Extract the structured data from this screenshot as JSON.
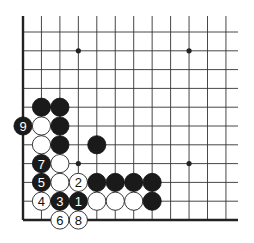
{
  "diagram": {
    "type": "go-board-partial",
    "corner": "bottom-left",
    "grid": {
      "cols": 12,
      "rows": 11,
      "x0": 23,
      "y0": 32,
      "dx": 18.45,
      "dy": 18.8,
      "top_extend": 16,
      "right_extend": 238
    },
    "star_points": [
      {
        "c": 3,
        "r": 1
      },
      {
        "c": 9,
        "r": 1
      },
      {
        "c": 3,
        "r": 7
      },
      {
        "c": 9,
        "r": 7
      }
    ],
    "stones": [
      {
        "c": 1,
        "r": 4,
        "color": "black",
        "label": ""
      },
      {
        "c": 2,
        "r": 4,
        "color": "black",
        "label": ""
      },
      {
        "c": 0,
        "r": 5,
        "color": "black",
        "label": "9"
      },
      {
        "c": 1,
        "r": 5,
        "color": "white",
        "label": ""
      },
      {
        "c": 2,
        "r": 5,
        "color": "black",
        "label": ""
      },
      {
        "c": 1,
        "r": 6,
        "color": "white",
        "label": ""
      },
      {
        "c": 2,
        "r": 6,
        "color": "black",
        "label": ""
      },
      {
        "c": 4,
        "r": 6,
        "color": "black",
        "label": ""
      },
      {
        "c": 1,
        "r": 7,
        "color": "black",
        "label": "7"
      },
      {
        "c": 2,
        "r": 7,
        "color": "white",
        "label": ""
      },
      {
        "c": 1,
        "r": 8,
        "color": "black",
        "label": "5"
      },
      {
        "c": 2,
        "r": 8,
        "color": "white",
        "label": ""
      },
      {
        "c": 3,
        "r": 8,
        "color": "white",
        "label": "2"
      },
      {
        "c": 4,
        "r": 8,
        "color": "black",
        "label": ""
      },
      {
        "c": 5,
        "r": 8,
        "color": "black",
        "label": ""
      },
      {
        "c": 6,
        "r": 8,
        "color": "black",
        "label": ""
      },
      {
        "c": 7,
        "r": 8,
        "color": "black",
        "label": ""
      },
      {
        "c": 1,
        "r": 9,
        "color": "white",
        "label": "4"
      },
      {
        "c": 2,
        "r": 9,
        "color": "black",
        "label": "3"
      },
      {
        "c": 3,
        "r": 9,
        "color": "black",
        "label": "1"
      },
      {
        "c": 4,
        "r": 9,
        "color": "white",
        "label": ""
      },
      {
        "c": 5,
        "r": 9,
        "color": "white",
        "label": ""
      },
      {
        "c": 6,
        "r": 9,
        "color": "white",
        "label": ""
      },
      {
        "c": 7,
        "r": 9,
        "color": "black",
        "label": ""
      },
      {
        "c": 2,
        "r": 10,
        "color": "white",
        "label": "6"
      },
      {
        "c": 3,
        "r": 10,
        "color": "white",
        "label": "8"
      }
    ],
    "colors": {
      "black_stone": "#1a1a1a",
      "white_stone": "#ffffff",
      "line": "#333333"
    }
  }
}
